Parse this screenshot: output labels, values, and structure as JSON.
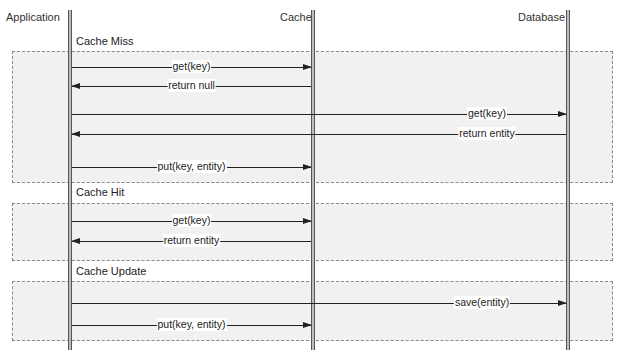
{
  "participants": [
    {
      "name": "Application",
      "x": 70
    },
    {
      "name": "Cache",
      "x": 313
    },
    {
      "name": "Database",
      "x": 568
    }
  ],
  "frames": [
    {
      "title": "Cache Miss",
      "messages": [
        {
          "label": "get(key)",
          "from": "Application",
          "to": "Cache"
        },
        {
          "label": "return null",
          "from": "Cache",
          "to": "Application"
        },
        {
          "label": "get(key)",
          "from": "Application",
          "to": "Database"
        },
        {
          "label": "return entity",
          "from": "Database",
          "to": "Application"
        },
        {
          "label": "put(key, entity)",
          "from": "Application",
          "to": "Cache"
        }
      ]
    },
    {
      "title": "Cache Hit",
      "messages": [
        {
          "label": "get(key)",
          "from": "Application",
          "to": "Cache"
        },
        {
          "label": "return entity",
          "from": "Cache",
          "to": "Application"
        }
      ]
    },
    {
      "title": "Cache Update",
      "messages": [
        {
          "label": "save(entity)",
          "from": "Application",
          "to": "Database"
        },
        {
          "label": "put(key, entity)",
          "from": "Application",
          "to": "Cache"
        }
      ]
    }
  ],
  "colors": {
    "frame_fill": "#f1f1f1",
    "frame_border": "#8a8a8a",
    "lifeline": "#bdbdbd",
    "line": "#222222"
  }
}
